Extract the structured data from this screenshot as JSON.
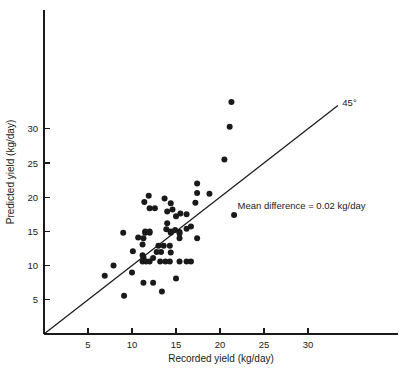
{
  "chart_data": {
    "type": "scatter",
    "title": "",
    "xlabel": "Recorded yield (kg/day)",
    "ylabel": "Predicted yield (kg/day)",
    "xlim": [
      0,
      36
    ],
    "ylim": [
      0,
      36
    ],
    "xticks": [
      5,
      10,
      15,
      20,
      25,
      30
    ],
    "xtick_labels": [
      "5",
      "10",
      "15",
      "20",
      "25",
      "30"
    ],
    "yticks": [
      5,
      10,
      15,
      20,
      25,
      30
    ],
    "ytick_labels": [
      "5",
      "10",
      "15",
      "20",
      "25",
      "30"
    ],
    "grid": false,
    "legend": null,
    "annotations": [
      {
        "name": "mean-difference-note",
        "text": "Mean difference = 0.02 kg/day",
        "x": 22.0,
        "y": 18.3
      },
      {
        "name": "identity-line-label",
        "text": "45°",
        "x": 33.9,
        "y": 33.4
      }
    ],
    "reference_line": {
      "name": "identity-line",
      "label": "45°",
      "slope": 1,
      "intercept": 0,
      "x_start": 0,
      "x_end": 33.4
    },
    "marker": {
      "shape": "circle",
      "color": "#1a1a1a",
      "size_px": 3.0
    },
    "points": [
      [
        21.3,
        33.9
      ],
      [
        21.1,
        30.3
      ],
      [
        20.5,
        25.5
      ],
      [
        17.4,
        22.0
      ],
      [
        17.4,
        20.6
      ],
      [
        18.8,
        20.5
      ],
      [
        11.9,
        20.2
      ],
      [
        13.7,
        19.8
      ],
      [
        11.4,
        19.3
      ],
      [
        17.2,
        19.2
      ],
      [
        14.4,
        19.1
      ],
      [
        12.0,
        18.4
      ],
      [
        12.6,
        18.4
      ],
      [
        14.6,
        18.2
      ],
      [
        14.0,
        17.9
      ],
      [
        15.5,
        17.6
      ],
      [
        16.2,
        17.5
      ],
      [
        21.6,
        17.4
      ],
      [
        15.0,
        17.2
      ],
      [
        14.0,
        16.2
      ],
      [
        16.7,
        15.7
      ],
      [
        16.2,
        15.4
      ],
      [
        13.9,
        15.3
      ],
      [
        14.9,
        15.2
      ],
      [
        11.5,
        15.0
      ],
      [
        12.0,
        15.0
      ],
      [
        14.4,
        15.0
      ],
      [
        15.4,
        14.9
      ],
      [
        9.0,
        14.8
      ],
      [
        11.5,
        14.8
      ],
      [
        12.0,
        14.8
      ],
      [
        14.4,
        14.8
      ],
      [
        15.4,
        14.7
      ],
      [
        10.7,
        14.1
      ],
      [
        11.3,
        14.0
      ],
      [
        15.4,
        14.0
      ],
      [
        17.4,
        14.0
      ],
      [
        11.2,
        13.1
      ],
      [
        13.0,
        12.9
      ],
      [
        13.6,
        12.9
      ],
      [
        14.3,
        12.9
      ],
      [
        10.1,
        12.1
      ],
      [
        12.8,
        12.0
      ],
      [
        13.3,
        12.0
      ],
      [
        14.4,
        11.9
      ],
      [
        11.2,
        11.5
      ],
      [
        11.3,
        11.2
      ],
      [
        12.4,
        11.1
      ],
      [
        11.2,
        10.6
      ],
      [
        11.6,
        10.6
      ],
      [
        12.0,
        10.6
      ],
      [
        13.2,
        10.6
      ],
      [
        13.8,
        10.6
      ],
      [
        14.3,
        10.6
      ],
      [
        15.4,
        10.6
      ],
      [
        16.2,
        10.6
      ],
      [
        16.7,
        10.6
      ],
      [
        7.9,
        10.0
      ],
      [
        10.0,
        9.0
      ],
      [
        6.9,
        8.5
      ],
      [
        15.0,
        8.1
      ],
      [
        11.3,
        7.5
      ],
      [
        12.4,
        7.5
      ],
      [
        13.4,
        6.2
      ],
      [
        9.1,
        5.6
      ]
    ]
  }
}
